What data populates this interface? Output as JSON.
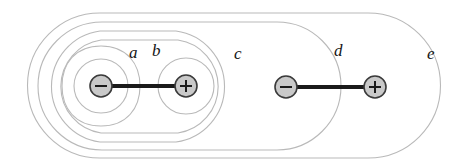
{
  "figure": {
    "background_color": "#ffffff",
    "width": 462,
    "height": 165,
    "contour_color": "#b9b9b9",
    "rod_color": "#1a1a1a",
    "charge_outline_color": "#3a3a3a",
    "charge_fill_color": "#c9c9c9",
    "label_color": "#151515"
  },
  "labels": [
    {
      "id": "a",
      "text": "a",
      "x": 129,
      "y": 44
    },
    {
      "id": "b",
      "text": "b",
      "x": 152,
      "y": 42
    },
    {
      "id": "c",
      "text": "c",
      "x": 234,
      "y": 45
    },
    {
      "id": "d",
      "text": "d",
      "x": 334,
      "y": 42
    },
    {
      "id": "e",
      "text": "e",
      "x": 427,
      "y": 45
    }
  ],
  "dipoles": [
    {
      "id": "dipole-left",
      "negative": {
        "cx": 101,
        "cy": 86,
        "r": 11,
        "sign": "−"
      },
      "positive": {
        "cx": 186,
        "cy": 86,
        "r": 11,
        "sign": "+"
      },
      "rod": {
        "x1": 101,
        "y1": 86,
        "x2": 186,
        "y2": 86
      }
    },
    {
      "id": "dipole-right",
      "negative": {
        "cx": 286,
        "cy": 87,
        "r": 11,
        "sign": "−"
      },
      "positive": {
        "cx": 375,
        "cy": 87,
        "r": 11,
        "sign": "+"
      },
      "rod": {
        "x1": 286,
        "y1": 87,
        "x2": 375,
        "y2": 87
      }
    }
  ],
  "contours": [
    {
      "id": "contour-a-inner",
      "label": "a",
      "kind": "circle-around-negative",
      "cx": 101,
      "cy": 86,
      "rx": 26,
      "ry": 26
    },
    {
      "id": "contour-b-inner",
      "label": "b",
      "kind": "circle-around-positive",
      "cx": 186,
      "cy": 86,
      "rx": 27,
      "ry": 27
    },
    {
      "id": "contour-a-2",
      "label": "a",
      "kind": "circle-around-negative",
      "cx": 101,
      "cy": 86,
      "rx": 38,
      "ry": 40
    },
    {
      "id": "contour-c-1",
      "label": "c",
      "kind": "enclose-left-dipole",
      "left": 57,
      "right": 225,
      "top": 40,
      "bottom": 133
    },
    {
      "id": "contour-c-2",
      "label": "c",
      "kind": "enclose-left-dipole",
      "left": 47,
      "right": 232,
      "top": 31,
      "bottom": 142
    },
    {
      "id": "contour-d",
      "label": "d",
      "kind": "enclose-left-dipole-wide",
      "left": 38,
      "right": 341,
      "top": 22,
      "bottom": 150
    },
    {
      "id": "contour-e",
      "label": "e",
      "kind": "enclose-all",
      "left": 28,
      "right": 440,
      "top": 13,
      "bottom": 158
    }
  ],
  "caption": ""
}
